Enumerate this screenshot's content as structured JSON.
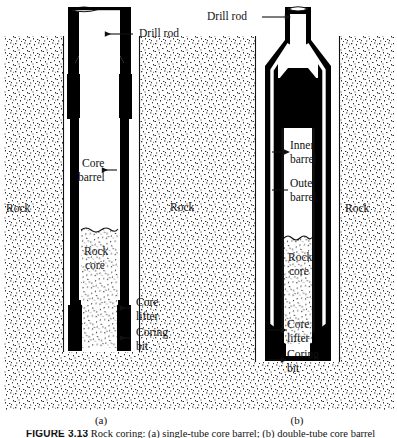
{
  "figure": {
    "caption_label": "FIGURE 3.13",
    "caption_rest": "Rock coring: (a) single-tube core barrel; (b) double-tube core barrel",
    "panels": [
      {
        "letter": "(a)",
        "name": "single-tube-core-barrel"
      },
      {
        "letter": "(b)",
        "name": "double-tube-core-barrel"
      }
    ]
  },
  "colors": {
    "ink": "#111111",
    "paper": "#ffffff",
    "steel_fill": "#000000",
    "rock_stipple": "#2b2b2b"
  },
  "panel_a": {
    "labels": {
      "drill_rod": "Drill rod",
      "core_barrel_line1": "Core",
      "core_barrel_line2": "barrel",
      "rock_left": "Rock",
      "rock_core_line1": "Rock",
      "rock_core_line2": "core",
      "core_lifter_line1": "Core",
      "core_lifter_line2": "lifter",
      "coring_bit_line1": "Coring",
      "coring_bit_line2": "bit"
    }
  },
  "panel_middle": {
    "labels": {
      "rock_middle": "Rock"
    }
  },
  "panel_b": {
    "labels": {
      "drill_rod": "Drill rod",
      "inner_barrel_line1": "Inner",
      "inner_barrel_line2": "barrel",
      "outer_barrel_line1": "Outer",
      "outer_barrel_line2": "barrel",
      "rock_right": "Rock",
      "rock_core_line1": "Rock",
      "rock_core_line2": "core",
      "core_lifter_line1": "Core",
      "core_lifter_line2": "lifter",
      "coring_bit_line1": "Coring",
      "coring_bit_line2": "bit"
    }
  }
}
